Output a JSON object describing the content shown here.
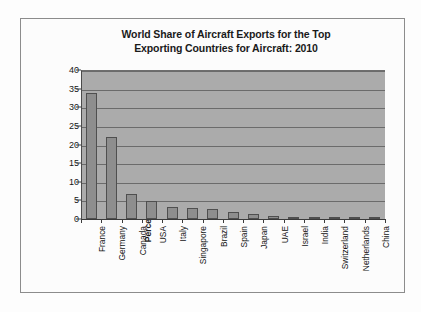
{
  "chart_data": {
    "type": "bar",
    "title": "World Share of Aircraft Exports for the Top Exporting Countries for Aircraft: 2010",
    "title_lines": [
      "World Share of Aircraft Exports for the Top",
      "Exporting Countries for Aircraft: 2010"
    ],
    "xlabel": "",
    "ylabel": "Percentage of Global Aircraft Exports of a Given Country",
    "ylabel_lines": [
      "Percentage of Global Aircraft Exports of a",
      "Given Country"
    ],
    "categories": [
      "France",
      "Germany",
      "Canada",
      "USA",
      "Italy",
      "Singapore",
      "Brazil",
      "Spain",
      "Japan",
      "UAE",
      "Israel",
      "India",
      "Switzerland",
      "Netherlands",
      "China"
    ],
    "values": [
      33.7,
      22.0,
      6.7,
      4.9,
      3.1,
      3.0,
      2.7,
      2.0,
      1.4,
      0.8,
      0.5,
      0.5,
      0.5,
      0.5,
      0.3
    ],
    "ylim": [
      0,
      40
    ],
    "ytick_labels": [
      "0",
      "5",
      "10",
      "15",
      "20",
      "25",
      "30",
      "35",
      "40"
    ],
    "ytick_values": [
      0,
      5,
      10,
      15,
      20,
      25,
      30,
      35,
      40
    ],
    "grid": true,
    "legend": false,
    "colors": {
      "bar_fill": "#8e8e8e",
      "bar_border": "#4f4f4f",
      "plot_background": "#ababab",
      "gridline": "#6b6b6b",
      "frame_border": "#8c8c8c",
      "text": "#141414"
    }
  }
}
